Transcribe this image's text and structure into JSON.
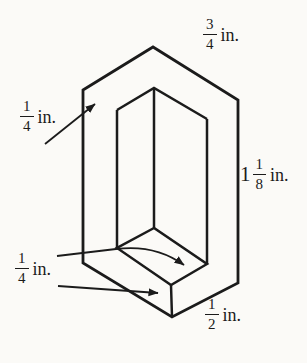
{
  "figure": {
    "colors": {
      "background": "#fbfaf7",
      "line": "#1b1b1b",
      "text": "#1b1b1b"
    }
  },
  "labels": {
    "top": {
      "num": "3",
      "den": "4",
      "unit": "in."
    },
    "left": {
      "num": "1",
      "den": "4",
      "unit": "in."
    },
    "right": {
      "whole": "1",
      "num": "1",
      "den": "8",
      "unit": "in."
    },
    "bottom_left": {
      "num": "1",
      "den": "4",
      "unit": "in."
    },
    "bottom_right": {
      "num": "1",
      "den": "2",
      "unit": "in."
    }
  }
}
